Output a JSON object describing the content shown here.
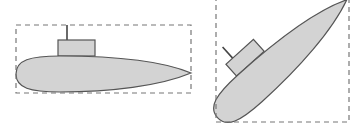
{
  "figure": {
    "colors": {
      "background": "#ffffff",
      "hull_fill": "#d3d3d3",
      "outline": "#555555",
      "bbox_stroke": "#777777"
    },
    "shapes": [
      {
        "name": "submarine-horizontal",
        "rotation_deg": 0
      },
      {
        "name": "submarine-rotated",
        "rotation_deg": -42
      }
    ]
  }
}
